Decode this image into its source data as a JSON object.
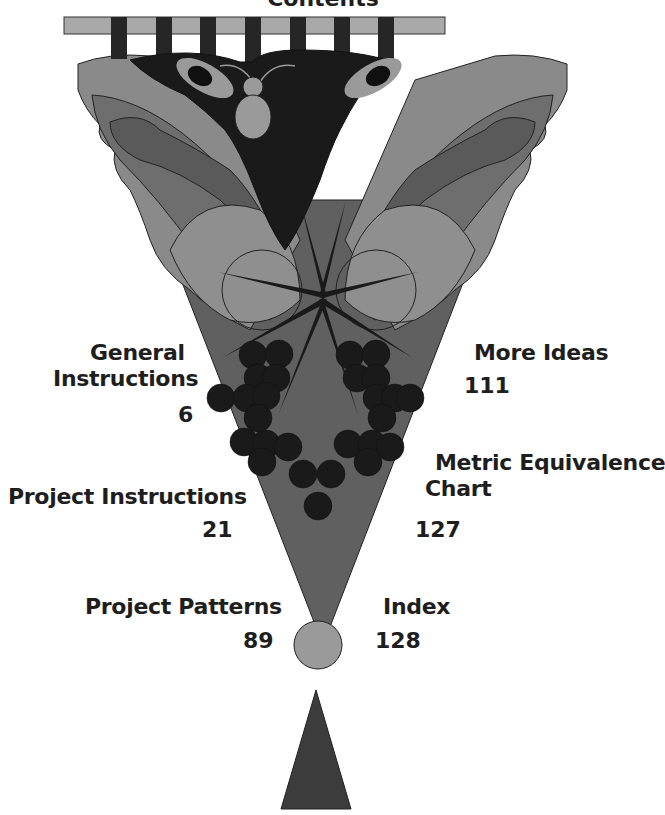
{
  "page": {
    "title": "Contents"
  },
  "toc": {
    "left": [
      {
        "label_line1": "General",
        "label_line2": "Instructions",
        "page": "6"
      },
      {
        "label_line1": "Project Instructions",
        "page": "21"
      },
      {
        "label_line1": "Project Patterns",
        "page": "89"
      }
    ],
    "right": [
      {
        "label_line1": "More Ideas",
        "page": "111"
      },
      {
        "label_line1": "Metric Equivalence",
        "label_line2": "Chart",
        "page": "127"
      },
      {
        "label_line1": "Index",
        "page": "128"
      }
    ]
  },
  "colors": {
    "rod": "#a9a9a9",
    "tab": "#262626",
    "dark": "#1a1a1a",
    "mid": "#6e6e6e",
    "light": "#9a9a9a",
    "lighter": "#b8b8b8",
    "cone": "#595959",
    "text": "#1e1e1e"
  }
}
